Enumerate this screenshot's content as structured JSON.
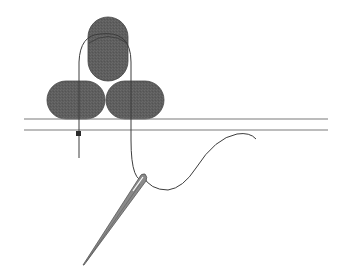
{
  "diagram": {
    "colors": {
      "background": "#ffffff",
      "cord_fill": "#5e5e5e",
      "cord_stroke": "#3a3a3a",
      "fabric_line": "#7a7a7a",
      "thread": "#3c3c3c",
      "needle": "#6a6a6a",
      "knot": "#2a2a2a"
    },
    "elements": {
      "cords": [
        {
          "id": "cord-top",
          "label": "top cord"
        },
        {
          "id": "cord-bottom-left",
          "label": "bottom left cord"
        },
        {
          "id": "cord-bottom-right",
          "label": "bottom right cord"
        }
      ],
      "fabric_lines": 2,
      "thread": "thread loop over cords",
      "needle": "needle with threaded eye",
      "knot": "knot below fabric"
    }
  }
}
